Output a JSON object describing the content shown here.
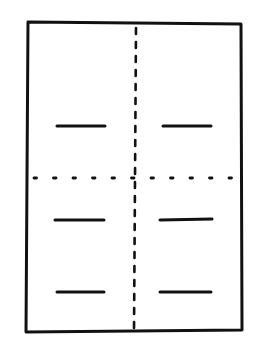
{
  "diagram": {
    "type": "sheet-fold-pattern",
    "stroke_color": "#111111",
    "background": "#ffffff",
    "sheet": {
      "x1": 27,
      "y1": 22,
      "x2": 242,
      "y2": 332
    },
    "vertical_fold": {
      "x": 135,
      "y1": 26,
      "y2": 332,
      "style": "dash-dot"
    },
    "horizontal_fold": {
      "y": 178,
      "x1": 32,
      "x2": 240,
      "style": "dotted"
    },
    "cut_marks": [
      {
        "name": "upper-left",
        "x1": 57,
        "x2": 105,
        "y": 126
      },
      {
        "name": "upper-right",
        "x1": 163,
        "x2": 211,
        "y": 126
      },
      {
        "name": "middle-left",
        "x1": 55,
        "x2": 104,
        "y": 219
      },
      {
        "name": "middle-right",
        "x1": 159,
        "x2": 212,
        "y": 219
      },
      {
        "name": "lower-left",
        "x1": 57,
        "x2": 104,
        "y": 292
      },
      {
        "name": "lower-right",
        "x1": 159,
        "x2": 211,
        "y": 292
      }
    ]
  }
}
